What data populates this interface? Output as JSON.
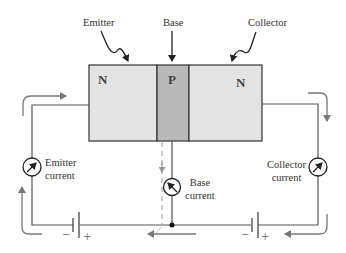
{
  "diagram": {
    "top_labels": {
      "emitter": "Emitter",
      "base": "Base",
      "collector": "Collector"
    },
    "regions": [
      {
        "id": "emitter-region",
        "label": "N",
        "color": "#e3e3e3"
      },
      {
        "id": "base-region",
        "label": "P",
        "color": "#b9b9b9"
      },
      {
        "id": "collector-region",
        "label": "N",
        "color": "#e3e3e3"
      }
    ],
    "meters": {
      "emitter": {
        "line1": "Emitter",
        "line2": "current"
      },
      "base": {
        "line1": "Base",
        "line2": "current"
      },
      "collector": {
        "line1": "Collector",
        "line2": "current"
      }
    },
    "batteries": {
      "left": {
        "minus": "−",
        "plus": "+"
      },
      "right": {
        "minus": "−",
        "plus": "+"
      }
    },
    "colors": {
      "wire": "#555555",
      "flow_arrow": "#7a7a7a",
      "border": "#333333"
    }
  }
}
